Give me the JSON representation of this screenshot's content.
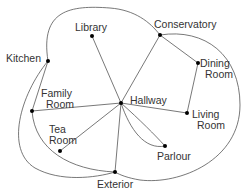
{
  "nodes": [
    {
      "id": "kitchen",
      "x": 48,
      "y": 61,
      "lines": [
        "Kitchen"
      ],
      "lx": 6,
      "ly": 62,
      "anchor": "start"
    },
    {
      "id": "library",
      "x": 92,
      "y": 36,
      "lines": [
        "Library"
      ],
      "lx": 75,
      "ly": 31,
      "anchor": "start"
    },
    {
      "id": "conservatory",
      "x": 160,
      "y": 35,
      "lines": [
        "Conservatory"
      ],
      "lx": 154,
      "ly": 28,
      "anchor": "start"
    },
    {
      "id": "dining-room",
      "x": 198,
      "y": 63,
      "lines": [
        "Dining",
        "Room"
      ],
      "lx": 200,
      "ly": 67,
      "anchor": "start"
    },
    {
      "id": "family-room",
      "x": 32,
      "y": 111,
      "lines": [
        "Family",
        "Room"
      ],
      "lx": 41,
      "ly": 97,
      "anchor": "start"
    },
    {
      "id": "hallway",
      "x": 121,
      "y": 103,
      "lines": [
        "Hallway"
      ],
      "lx": 130,
      "ly": 104,
      "anchor": "start"
    },
    {
      "id": "living-room",
      "x": 187,
      "y": 113,
      "lines": [
        "Living",
        "Room"
      ],
      "lx": 192,
      "ly": 118,
      "anchor": "start"
    },
    {
      "id": "tea-room",
      "x": 60,
      "y": 151,
      "lines": [
        "Tea",
        "Room"
      ],
      "lx": 49,
      "ly": 133,
      "anchor": "start"
    },
    {
      "id": "parlour",
      "x": 165,
      "y": 146,
      "lines": [
        "Parlour"
      ],
      "lx": 157,
      "ly": 160,
      "anchor": "start"
    },
    {
      "id": "exterior",
      "x": 115,
      "y": 172,
      "lines": [
        "Exterior"
      ],
      "lx": 97,
      "ly": 188,
      "anchor": "start"
    }
  ],
  "edges": [
    {
      "from": "kitchen",
      "to": "conservatory",
      "d": "M48,61 C40,10 70,5 110,8 C135,10 150,22 160,35"
    },
    {
      "from": "kitchen",
      "to": "family-room",
      "d": "M48,61 L32,111"
    },
    {
      "from": "kitchen",
      "to": "exterior",
      "d": "M48,61 C20,95 5,150 35,168 C60,182 95,178 115,172"
    },
    {
      "from": "library",
      "to": "hallway",
      "d": "M92,36 L121,103"
    },
    {
      "from": "conservatory",
      "to": "hallway",
      "d": "M160,35 L121,103"
    },
    {
      "from": "conservatory",
      "to": "dining-room",
      "d": "M160,35 L198,63"
    },
    {
      "from": "conservatory",
      "to": "exterior",
      "d": "M160,35 C205,28 240,55 240,105 C240,160 180,185 140,180 C128,178 120,175 115,172"
    },
    {
      "from": "dining-room",
      "to": "living-room",
      "d": "M198,63 L187,113"
    },
    {
      "from": "family-room",
      "to": "hallway",
      "d": "M32,111 L121,103"
    },
    {
      "from": "family-room",
      "to": "exterior",
      "d": "M32,111 C35,150 70,170 115,172"
    },
    {
      "from": "hallway",
      "to": "living-room",
      "d": "M121,103 L187,113"
    },
    {
      "from": "hallway",
      "to": "tea-room",
      "d": "M121,103 L60,151"
    },
    {
      "from": "hallway",
      "to": "parlour",
      "d": "M121,103 C130,130 145,150 165,146"
    },
    {
      "from": "hallway",
      "to": "parlour",
      "d": "M121,103 C140,120 155,135 165,146"
    },
    {
      "from": "hallway",
      "to": "exterior",
      "d": "M121,103 L115,172"
    }
  ],
  "colors": {
    "edge": "#555555",
    "node": "#000000",
    "label": "#333333"
  }
}
